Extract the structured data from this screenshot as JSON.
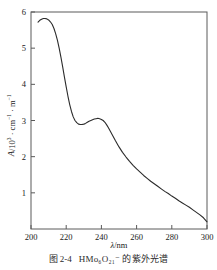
{
  "figure": {
    "caption_number": "图 2-4",
    "caption_text": "HMo₆O₂₁⁻ 的紫外光谱",
    "caption_full": "图 2-4   HMo₆O₂₁⁻ 的紫外光谱"
  },
  "axes": {
    "x_title_symbol": "λ",
    "x_title_unit": "/nm",
    "y_title_symbol": "A",
    "y_title_unit": "/10³ · cm⁻¹ · m⁻¹",
    "x_ticks": [
      "200",
      "220",
      "240",
      "260",
      "280",
      "300"
    ],
    "y_ticks": [
      "1",
      "2",
      "3",
      "4",
      "5",
      "6"
    ]
  },
  "chart_data": {
    "type": "line",
    "xlabel": "λ/nm",
    "ylabel": "A/10³ · cm⁻¹ · m⁻¹",
    "xlim": [
      200,
      300
    ],
    "ylim": [
      0,
      6
    ],
    "xticks": [
      200,
      220,
      240,
      260,
      280,
      300
    ],
    "yticks": [
      1,
      2,
      3,
      4,
      5,
      6
    ],
    "grid": false,
    "legend": "none",
    "line_color": "#2b2b2b",
    "line_width": 1.1,
    "annotations": [
      {
        "label": "primary maximum",
        "x": 208,
        "y": 5.82
      },
      {
        "label": "local minimum (shoulder trough)",
        "x": 229,
        "y": 2.9
      },
      {
        "label": "secondary maximum",
        "x": 238,
        "y": 3.06
      },
      {
        "label": "tail end",
        "x": 300,
        "y": 0.2
      }
    ],
    "series": [
      {
        "name": "absorption",
        "x": [
          204,
          205,
          206,
          207,
          208,
          209,
          210,
          211,
          212,
          213,
          214,
          215,
          216,
          217,
          218,
          219,
          220,
          221,
          222,
          223,
          224,
          225,
          226,
          227,
          228,
          229,
          230,
          231,
          232,
          233,
          234,
          235,
          236,
          237,
          238,
          239,
          240,
          241,
          242,
          243,
          244,
          245,
          246,
          248,
          250,
          252,
          254,
          256,
          258,
          260,
          262,
          264,
          266,
          268,
          270,
          272,
          274,
          276,
          278,
          280,
          282,
          284,
          286,
          288,
          290,
          292,
          294,
          296,
          298,
          300
        ],
        "y": [
          5.72,
          5.77,
          5.8,
          5.82,
          5.82,
          5.81,
          5.78,
          5.73,
          5.66,
          5.55,
          5.4,
          5.22,
          5.0,
          4.75,
          4.48,
          4.2,
          3.93,
          3.67,
          3.44,
          3.25,
          3.1,
          3.0,
          2.94,
          2.9,
          2.89,
          2.89,
          2.9,
          2.92,
          2.95,
          2.98,
          3.0,
          3.02,
          3.04,
          3.05,
          3.06,
          3.05,
          3.03,
          3.0,
          2.95,
          2.88,
          2.8,
          2.71,
          2.62,
          2.44,
          2.27,
          2.12,
          1.99,
          1.87,
          1.76,
          1.66,
          1.57,
          1.48,
          1.4,
          1.32,
          1.25,
          1.18,
          1.11,
          1.04,
          0.98,
          0.91,
          0.85,
          0.78,
          0.72,
          0.66,
          0.6,
          0.53,
          0.46,
          0.39,
          0.31,
          0.2
        ]
      }
    ]
  }
}
